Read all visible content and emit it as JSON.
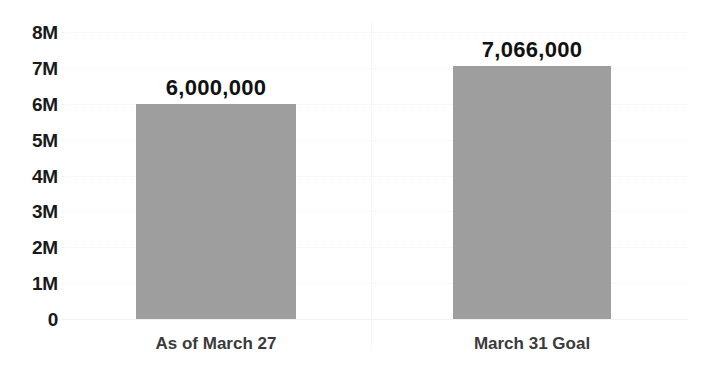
{
  "chart_data": {
    "type": "bar",
    "title": "",
    "subtitle": "",
    "xlabel": "",
    "ylabel": "",
    "categories": [
      "As of March 27",
      "March 31 Goal"
    ],
    "values": [
      6000000,
      7066000
    ],
    "value_labels": [
      "6,000,000",
      "7,066,000"
    ],
    "ylim": [
      0,
      8000000
    ],
    "y_ticks": [
      0,
      1000000,
      2000000,
      3000000,
      4000000,
      5000000,
      6000000,
      7000000,
      8000000
    ],
    "y_tick_labels": [
      "0",
      "1M",
      "2M",
      "3M",
      "4M",
      "5M",
      "6M",
      "7M",
      "8M"
    ],
    "grid": true,
    "legend": false,
    "legend_position": "none",
    "bar_color": "#9e9e9e",
    "background_color": "#ffffff",
    "gridline_color": "#f0f0f0",
    "axis_label_color": "#1a1a1a",
    "category_label_color": "#3b3b3b"
  }
}
